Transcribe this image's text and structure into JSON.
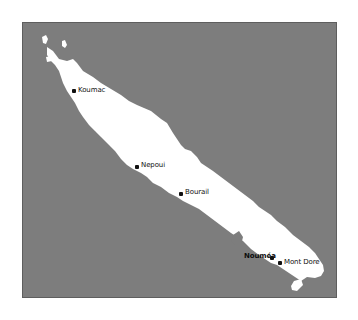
{
  "map": {
    "region": "New Caledonia (Grande Terre)",
    "colors": {
      "sea": "#7d7d7d",
      "land": "#ffffff",
      "frame_border": "#5e5e5e",
      "label": "#111111"
    },
    "cities": [
      {
        "name": "Koumac",
        "x": 73,
        "y": 89
      },
      {
        "name": "Nepoui",
        "x": 135,
        "y": 165
      },
      {
        "name": "Bourail",
        "x": 180,
        "y": 191
      },
      {
        "name": "Nouméa",
        "x": 270,
        "y": 256
      },
      {
        "name": "Mont Dore",
        "x": 278,
        "y": 261
      }
    ]
  }
}
